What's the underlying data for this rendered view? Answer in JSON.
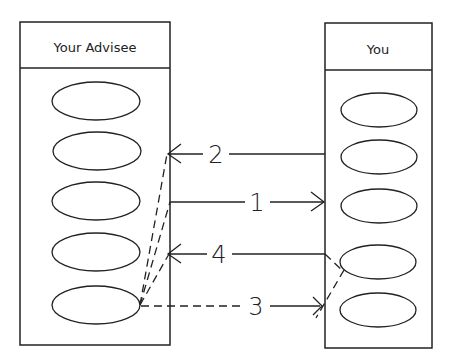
{
  "diagram": {
    "left_column": {
      "title": "Your Advisee",
      "ellipse_count": 5
    },
    "right_column": {
      "title": "You",
      "ellipse_count": 5
    },
    "arrows": [
      {
        "label": "2",
        "direction": "right-to-left",
        "style": "solid"
      },
      {
        "label": "1",
        "direction": "left-to-right",
        "style": "solid"
      },
      {
        "label": "4",
        "direction": "right-to-left",
        "style": "solid"
      },
      {
        "label": "3",
        "direction": "left-to-right",
        "style": "dashed"
      }
    ],
    "colors": {
      "stroke": "#222222",
      "background": "#ffffff"
    }
  }
}
